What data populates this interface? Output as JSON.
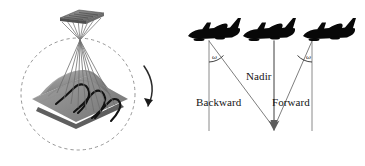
{
  "figure": {
    "background_color": "#ffffff",
    "ink_color": "#000000",
    "line_color": "#6e6e6e"
  },
  "left_panel": {
    "name": "convergent-acquisition-diagram",
    "sensor": {
      "name": "sensor-platform",
      "description": "satellite sensor plate"
    },
    "rays": {
      "name": "viewing-rays",
      "count": 9
    },
    "terrain": {
      "name": "terrain-surface",
      "contour_count": 3
    },
    "orbit": {
      "name": "dashed-orbit-circle",
      "style": "dashed"
    },
    "rotation_arrow": {
      "name": "rotation-arrow",
      "direction": "clockwise-down"
    }
  },
  "right_panel": {
    "name": "three-line-scanner-geometry",
    "aircraft": [
      {
        "name": "aircraft-backward",
        "position": "left"
      },
      {
        "name": "aircraft-nadir",
        "position": "center"
      },
      {
        "name": "aircraft-forward",
        "position": "right"
      }
    ],
    "labels": {
      "nadir": "Nadir",
      "backward": "Backward",
      "forward": "Forward"
    },
    "angles": {
      "left_symbol": "ω",
      "right_symbol": "ω"
    }
  }
}
